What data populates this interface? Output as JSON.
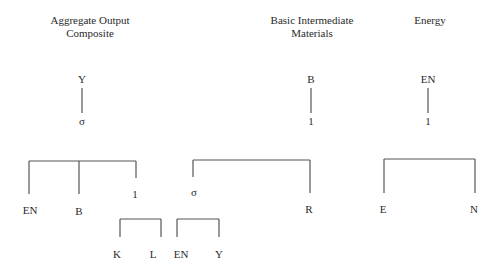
{
  "titles": {
    "aggregate_line1": "Aggregate Output",
    "aggregate_line2": "Composite",
    "basic_line1": "Basic Intermediate",
    "basic_line2": "Materials",
    "energy": "Energy"
  },
  "aggregate_tree": {
    "root": "Y",
    "elasticity": "σ",
    "children": [
      "EN",
      "B",
      "1"
    ],
    "sub_children": [
      "K",
      "L"
    ]
  },
  "basic_tree": {
    "root": "B",
    "elasticity": "1",
    "children": [
      "σ",
      "R"
    ],
    "sub_children": [
      "EN",
      "Y"
    ]
  },
  "energy_tree": {
    "root": "EN",
    "elasticity": "1",
    "children": [
      "E",
      "N"
    ]
  }
}
